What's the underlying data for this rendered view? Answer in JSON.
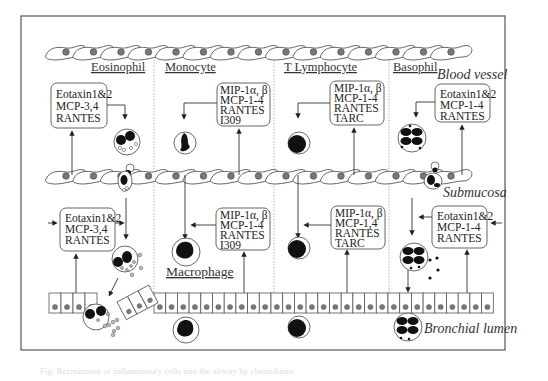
{
  "diagram": {
    "columns": [
      {
        "id": "eosinophil",
        "header": "Eosinophil"
      },
      {
        "id": "monocyte",
        "header": "Monocyte"
      },
      {
        "id": "t-lymphocyte",
        "header": "T Lymphocyte"
      },
      {
        "id": "basophil",
        "header": "Basophil"
      }
    ],
    "region_labels": {
      "blood_vessel": "Blood vessel",
      "submucosa": "Submucosa",
      "bronchial_lumen": "Bronchial lumen",
      "macrophage": "Macrophage"
    },
    "upper_boxes": [
      {
        "column": "eosinophil",
        "lines": [
          "Eotaxin1&2",
          "MCP-3,4",
          "RANTES"
        ]
      },
      {
        "column": "monocyte",
        "lines": [
          "MIP-1α, β",
          "MCP-1-4",
          "RANTES",
          "I309"
        ]
      },
      {
        "column": "t-lymphocyte",
        "lines": [
          "MIP-1α, β",
          "MCP-1-4",
          "RANTES",
          "TARC"
        ]
      },
      {
        "column": "basophil",
        "lines": [
          "Eotaxin1&2",
          "MCP-1-4",
          "RANTES"
        ]
      }
    ],
    "lower_boxes": [
      {
        "column": "eosinophil",
        "lines": [
          "Eotaxin1&2",
          "MCP-3,4",
          "RANTES"
        ]
      },
      {
        "column": "monocyte",
        "lines": [
          "MIP-1α, β",
          "MCP-1-4",
          "RANTES",
          "I309"
        ]
      },
      {
        "column": "t-lymphocyte",
        "lines": [
          "MIP-1α, β",
          "MCP-1,4",
          "RANTES",
          "TARC"
        ]
      },
      {
        "column": "basophil",
        "lines": [
          "Eotaxin1&2",
          "MCP-1-4",
          "RANTES"
        ]
      }
    ],
    "caption": "Fig. Recruitment of inflammatory cells into the airway by chemokines"
  },
  "colors": {
    "border": "#555555",
    "cell_nucleus": "#777777",
    "granule_dark": "#111111",
    "divider": "#999999"
  }
}
